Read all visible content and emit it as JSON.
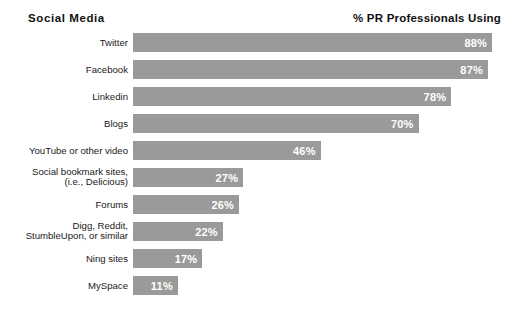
{
  "header": {
    "left_title": "Social  Media",
    "right_title": "% PR Professionals Using"
  },
  "colors": {
    "bar": "#9a9a9a",
    "value_text": "#ffffff",
    "label_text": "#1a1a1a",
    "background": "#ffffff"
  },
  "chart_data": {
    "type": "bar",
    "orientation": "horizontal",
    "title": "Social  Media",
    "xlabel": "% PR Professionals Using",
    "ylabel": "Social  Media",
    "xlim": [
      0,
      100
    ],
    "grid": false,
    "legend": false,
    "categories": [
      "Twitter",
      "Facebook",
      "Linkedin",
      "Blogs",
      "YouTube or other video",
      "Social bookmark sites,\n(i.e., Delicious)",
      "Forums",
      "Digg, Reddit,\nStumbleUpon, or similar",
      "Ning sites",
      "MySpace"
    ],
    "values": [
      88,
      87,
      78,
      70,
      46,
      27,
      26,
      22,
      17,
      11
    ],
    "value_labels": [
      "88%",
      "87%",
      "78%",
      "70%",
      "46%",
      "27%",
      "26%",
      "22%",
      "17%",
      "11%"
    ]
  },
  "bars": [
    {
      "label": "Twitter",
      "value": 88,
      "value_label": "88%"
    },
    {
      "label": "Facebook",
      "value": 87,
      "value_label": "87%"
    },
    {
      "label": "Linkedin",
      "value": 78,
      "value_label": "78%"
    },
    {
      "label": "Blogs",
      "value": 70,
      "value_label": "70%"
    },
    {
      "label": "YouTube or other video",
      "value": 46,
      "value_label": "46%"
    },
    {
      "label": "Social bookmark sites,\n(i.e., Delicious)",
      "value": 27,
      "value_label": "27%"
    },
    {
      "label": "Forums",
      "value": 26,
      "value_label": "26%"
    },
    {
      "label": "Digg, Reddit,\nStumbleUpon, or similar",
      "value": 22,
      "value_label": "22%"
    },
    {
      "label": "Ning sites",
      "value": 17,
      "value_label": "17%"
    },
    {
      "label": "MySpace",
      "value": 11,
      "value_label": "11%"
    }
  ]
}
